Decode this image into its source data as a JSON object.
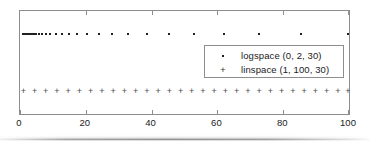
{
  "chart_data": {
    "type": "scatter",
    "title": "",
    "xlabel": "",
    "ylabel": "",
    "xlim": [
      0,
      100
    ],
    "ylim": [
      0,
      1
    ],
    "grid": false,
    "legend_position": "center-right",
    "xticks": [
      0,
      20,
      40,
      60,
      80,
      100
    ],
    "xtick_labels": [
      "0",
      "20",
      "40",
      "60",
      "80",
      "100"
    ],
    "yticks": [],
    "ytick_labels": [],
    "series": [
      {
        "name": "logspace (0, 2, 30)",
        "marker": "dot",
        "color": "#212121",
        "y": 0.78,
        "x": [
          1.0,
          1.1721,
          1.3738,
          1.6102,
          1.8874,
          2.2122,
          2.5929,
          3.0392,
          3.5622,
          4.1753,
          4.8939,
          5.7362,
          6.7234,
          7.8805,
          9.2367,
          10.8264,
          12.6896,
          14.8735,
          17.4333,
          20.4336,
          23.9503,
          28.0722,
          32.9034,
          38.5662,
          45.2035,
          52.9832,
          62.1017,
          72.7895,
          85.3168,
          100.0
        ]
      },
      {
        "name": "linspace (1, 100, 30)",
        "marker": "plus",
        "color": "#4a4a4a",
        "y": 0.22,
        "x": [
          1.0,
          4.4138,
          7.8276,
          11.2414,
          14.6552,
          18.069,
          21.4828,
          24.8966,
          28.3103,
          31.7241,
          35.1379,
          38.5517,
          41.9655,
          45.3793,
          48.7931,
          52.2069,
          55.6207,
          59.0345,
          62.4483,
          65.8621,
          69.2759,
          72.6897,
          76.1034,
          79.5172,
          82.931,
          86.3448,
          89.7586,
          93.1724,
          96.5862,
          100.0
        ]
      }
    ]
  },
  "legend": {
    "entries": [
      {
        "symbol": "•",
        "label": "logspace (0, 2, 30)"
      },
      {
        "symbol": "+",
        "label": "linspace (1, 100, 30)"
      }
    ]
  },
  "axis": {
    "xtick_labels": [
      "0",
      "20",
      "40",
      "60",
      "80",
      "100"
    ]
  },
  "colors": {
    "frame": "#8d8d8d",
    "marker_dot": "#212121",
    "marker_plus": "#4a4a4a",
    "text": "#1a1a1a",
    "background": "#ffffff"
  }
}
